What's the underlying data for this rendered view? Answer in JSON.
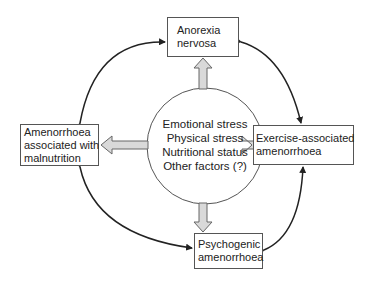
{
  "diagram": {
    "center": {
      "lines": [
        "Emotional stress",
        "Physical stress",
        "Nutritional status",
        "Other factors (?)"
      ]
    },
    "nodes": {
      "top": {
        "lines": [
          "Anorexia",
          "nervosa"
        ]
      },
      "left": {
        "lines": [
          "Amenorrhoea",
          "associated with",
          "malnutrition"
        ]
      },
      "right": {
        "lines": [
          "Exercise-associated",
          "amenorrhoea"
        ]
      },
      "bottom": {
        "lines": [
          "Psychogenic",
          "amenorrhoea"
        ]
      }
    },
    "colors": {
      "block_arrow_fill": "#d9d9d9",
      "block_arrow_stroke": "#666666",
      "curve_arrow": "#222222",
      "box_border": "#555555"
    }
  }
}
